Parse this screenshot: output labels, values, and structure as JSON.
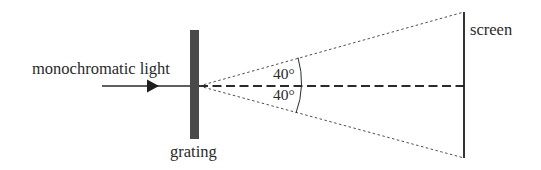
{
  "diagram": {
    "labels": {
      "light": "monochromatic light",
      "grating": "grating",
      "screen": "screen",
      "angle_upper": "40°",
      "angle_lower": "40°"
    },
    "geometry": {
      "grating": {
        "x": 190,
        "y": 30,
        "width": 9,
        "height": 109
      },
      "origin": {
        "x": 198,
        "y": 86
      },
      "screen": {
        "x": 464,
        "y_top": 12,
        "y_bottom": 158
      },
      "incoming_ray": {
        "x_start": 102,
        "x_end": 190,
        "y": 86
      },
      "angle_deg": 40
    },
    "colors": {
      "ink": "#2a2a2a",
      "grating_fill": "#4a4a4a",
      "background": "#ffffff"
    }
  }
}
